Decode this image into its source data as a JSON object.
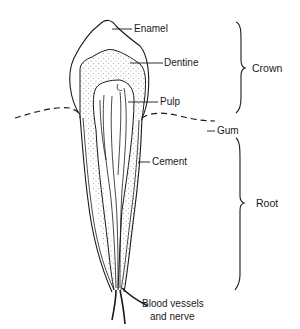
{
  "diagram": {
    "labels": {
      "enamel": "Enamel",
      "dentine": "Dentine",
      "pulp": "Pulp",
      "gum": "Gum",
      "cement": "Cement",
      "vessels_line1": "Blood vessels",
      "vessels_line2": "and nerve"
    },
    "regions": {
      "crown": "Crown",
      "root": "Root"
    },
    "colors": {
      "line": "#1a1a1a",
      "background": "#ffffff"
    }
  }
}
